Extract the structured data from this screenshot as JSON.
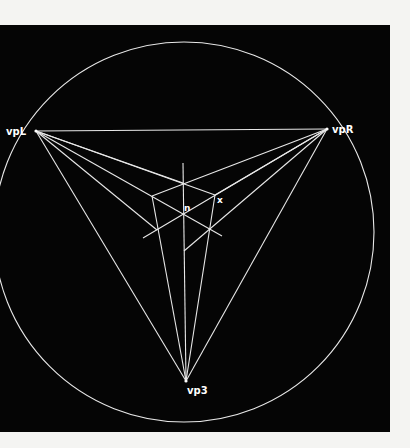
{
  "figure": {
    "background": "#050505",
    "page_color": "#f4f4f2",
    "stroke_color": "#e8e8e8",
    "circle": {
      "cx": 184,
      "cy": 232,
      "r": 190
    },
    "vanishing_points": [
      {
        "id": "vpL",
        "label": "vpL",
        "x": 36,
        "y": 131
      },
      {
        "id": "vpR",
        "label": "vpR",
        "x": 327,
        "y": 129
      },
      {
        "id": "vp3",
        "label": "vp3",
        "x": 186,
        "y": 381
      }
    ],
    "points": {
      "top": {
        "x": 183,
        "y": 183
      },
      "left": {
        "x": 152,
        "y": 196
      },
      "right": {
        "x": 215,
        "y": 195
      },
      "n": {
        "x": 184,
        "y": 214
      },
      "li": {
        "x": 157,
        "y": 230
      },
      "ri": {
        "x": 210,
        "y": 229
      },
      "bottom": {
        "x": 184,
        "y": 251
      }
    },
    "labels": {
      "n": "n",
      "x": "x",
      "vpL": "vpL",
      "vpR": "vpR",
      "vp3": "vp3"
    }
  }
}
